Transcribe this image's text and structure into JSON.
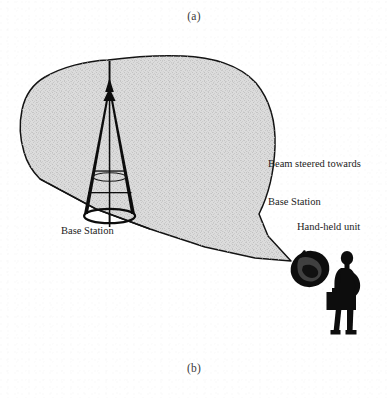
{
  "figure": {
    "part_labels": {
      "top": "(a)",
      "bottom": "(b)"
    },
    "annotations": {
      "beam_label_line1": "Beam steered towards",
      "beam_label_line2": "Base Station",
      "base_station_label": "Base Station",
      "handheld_label": "Hand-held unit"
    },
    "colors": {
      "beam_fill": "#d9d9d9",
      "beam_outline": "#141414",
      "tower": "#0d0d0d",
      "silhouette": "#0d0d0d",
      "text": "#1c1c1c",
      "background": "#ffffff"
    },
    "elements": {
      "beam_lobe": "beam-lobe",
      "base_station_tower": "base-station-tower",
      "handheld_device": "handheld-device",
      "person": "person-silhouette"
    }
  }
}
